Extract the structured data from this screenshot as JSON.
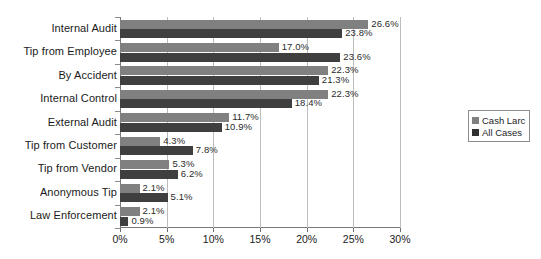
{
  "chart_data": {
    "type": "bar",
    "orientation": "horizontal",
    "title": "",
    "xlabel": "",
    "ylabel": "",
    "xlim": [
      0,
      30
    ],
    "xticks": [
      "0%",
      "5%",
      "10%",
      "15%",
      "20%",
      "25%",
      "30%"
    ],
    "xtick_values": [
      0,
      5,
      10,
      15,
      20,
      25,
      30
    ],
    "grid": "vertical",
    "legend_position": "right",
    "categories": [
      "Internal Audit",
      "Tip from Employee",
      "By Accident",
      "Internal Control",
      "External Audit",
      "Tip from Customer",
      "Tip from Vendor",
      "Anonymous Tip",
      "Law Enforcement"
    ],
    "series": [
      {
        "name": "Cash Larc",
        "color": "#808080",
        "values": [
          26.6,
          17.0,
          22.3,
          22.3,
          11.7,
          4.3,
          5.3,
          2.1,
          2.1
        ],
        "labels": [
          "26.6%",
          "17.0%",
          "22.3%",
          "22.3%",
          "11.7%",
          "4.3%",
          "5.3%",
          "2.1%",
          "2.1%"
        ]
      },
      {
        "name": "All Cases",
        "color": "#3f3f3f",
        "values": [
          23.8,
          23.6,
          21.3,
          18.4,
          10.9,
          7.8,
          6.2,
          5.1,
          0.9
        ],
        "labels": [
          "23.8%",
          "23.6%",
          "21.3%",
          "18.4%",
          "10.9%",
          "7.8%",
          "6.2%",
          "5.1%",
          "0.9%"
        ]
      }
    ]
  },
  "legend": {
    "items": [
      {
        "label": "Cash Larc",
        "color": "#808080"
      },
      {
        "label": "All Cases",
        "color": "#303030"
      }
    ]
  }
}
